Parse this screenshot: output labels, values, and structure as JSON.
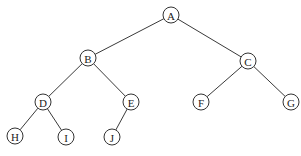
{
  "diagram": {
    "type": "binary-tree",
    "node_radius": 8,
    "colors": {
      "edge": "#3a3a3a",
      "node_stroke": "#333333",
      "node_fill": "#ffffff",
      "text": "#222222"
    },
    "nodes": [
      {
        "id": "A",
        "label": "A",
        "x": 171,
        "y": 15
      },
      {
        "id": "B",
        "label": "B",
        "x": 88,
        "y": 58
      },
      {
        "id": "C",
        "label": "C",
        "x": 248,
        "y": 61
      },
      {
        "id": "D",
        "label": "D",
        "x": 43,
        "y": 102
      },
      {
        "id": "E",
        "label": "E",
        "x": 131,
        "y": 102
      },
      {
        "id": "F",
        "label": "F",
        "x": 201,
        "y": 102
      },
      {
        "id": "G",
        "label": "G",
        "x": 291,
        "y": 102
      },
      {
        "id": "H",
        "label": "H",
        "x": 15,
        "y": 136
      },
      {
        "id": "I",
        "label": "I",
        "x": 66,
        "y": 137
      },
      {
        "id": "J",
        "label": "J",
        "x": 112,
        "y": 137
      }
    ],
    "edges": [
      [
        "A",
        "B"
      ],
      [
        "A",
        "C"
      ],
      [
        "B",
        "D"
      ],
      [
        "B",
        "E"
      ],
      [
        "C",
        "F"
      ],
      [
        "C",
        "G"
      ],
      [
        "D",
        "H"
      ],
      [
        "D",
        "I"
      ],
      [
        "E",
        "J"
      ]
    ]
  }
}
